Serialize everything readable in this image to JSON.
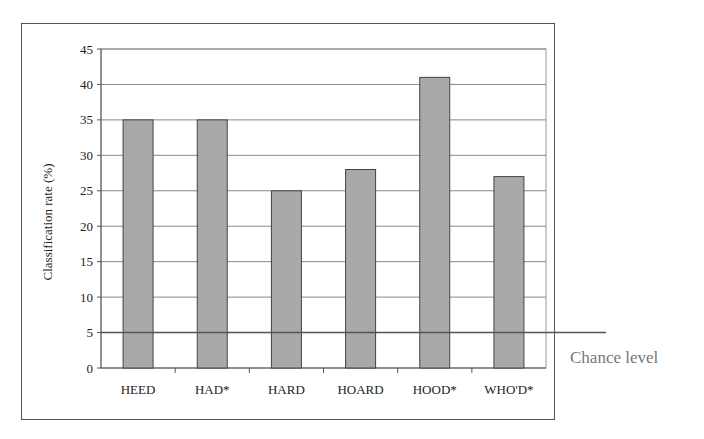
{
  "chart_data": {
    "type": "bar",
    "title": "",
    "xlabel": "",
    "ylabel": "Classification rate (%)",
    "categories": [
      "HEED",
      "HAD*",
      "HARD",
      "HOARD",
      "HOOD*",
      "WHO'D*"
    ],
    "values": [
      35,
      35,
      25,
      28,
      41,
      27
    ],
    "ylim": [
      0,
      45
    ],
    "yticks": [
      0,
      5,
      10,
      15,
      20,
      25,
      30,
      35,
      40,
      45
    ],
    "grid": true,
    "legend": null,
    "annotations": [
      {
        "type": "hline",
        "y": 5,
        "label": "Chance level"
      }
    ],
    "bar_color": "#a9a9a9"
  },
  "labels": {
    "ylabel": "Classification rate (%)",
    "chance": "Chance level"
  }
}
